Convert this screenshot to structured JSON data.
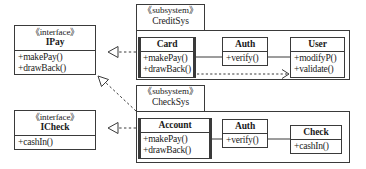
{
  "diagram": {
    "type": "uml-class-diagram",
    "stereotype_interface": "《interface》",
    "stereotype_subsystem": "《subsystem》",
    "colors": {
      "line": "#3a3a3a",
      "background": "#ffffff",
      "text": "#1a1a1a"
    }
  },
  "interfaces": [
    {
      "id": "ipay",
      "stereotype": "《interface》",
      "name": "IPay",
      "operations": [
        "+makePay()",
        "+drawBack()"
      ]
    },
    {
      "id": "icheck",
      "stereotype": "《interface》",
      "name": "ICheck",
      "operations": [
        "+cashIn()"
      ]
    }
  ],
  "subsystems": [
    {
      "id": "creditsys",
      "stereotype": "《subsystem》",
      "name": "CreditSys",
      "classes": [
        {
          "id": "card",
          "name": "Card",
          "operations": [
            "+makePay()",
            "+drawBack()"
          ]
        },
        {
          "id": "credit-auth",
          "name": "Auth",
          "operations": [
            "+verify()"
          ]
        },
        {
          "id": "user",
          "name": "User",
          "operations": [
            "+modifyP()",
            "+validate()"
          ]
        }
      ]
    },
    {
      "id": "checksys",
      "stereotype": "《subsystem》",
      "name": "CheckSys",
      "classes": [
        {
          "id": "account",
          "name": "Account",
          "operations": [
            "+makePay()",
            "+drawBack()"
          ]
        },
        {
          "id": "check-auth",
          "name": "Auth",
          "operations": [
            "+verify()"
          ]
        },
        {
          "id": "check",
          "name": "Check",
          "operations": [
            "+cashIn()"
          ]
        }
      ]
    }
  ],
  "relationships": [
    {
      "id": "rel-credit-ipay",
      "kind": "realization",
      "from": "CreditSys",
      "to": "IPay"
    },
    {
      "id": "rel-check-ipay",
      "kind": "realization",
      "from": "CheckSys",
      "to": "IPay"
    },
    {
      "id": "rel-check-icheck",
      "kind": "realization",
      "from": "CheckSys",
      "to": "ICheck"
    },
    {
      "id": "rel-card-user",
      "kind": "dependency",
      "from": "Card",
      "to": "User"
    },
    {
      "id": "rel-card-auth",
      "kind": "association",
      "from": "Card",
      "to": "Auth"
    },
    {
      "id": "rel-auth-user",
      "kind": "association",
      "from": "Auth",
      "to": "User"
    },
    {
      "id": "rel-account-auth",
      "kind": "association",
      "from": "Account",
      "to": "Auth"
    },
    {
      "id": "rel-auth-check",
      "kind": "association",
      "from": "Auth",
      "to": "Check"
    }
  ]
}
